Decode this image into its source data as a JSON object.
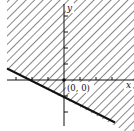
{
  "diagram": {
    "type": "inequality-graph",
    "labels": {
      "x_axis": "x",
      "y_axis": "y",
      "origin": "(0, 0)"
    },
    "boundary_line": {
      "equation": "y = -x/2 - 1",
      "style": "solid"
    },
    "shaded_region": "above boundary line",
    "colors": {
      "ink": "#111111",
      "hatch": "#222222",
      "background": "#ffffff"
    }
  }
}
